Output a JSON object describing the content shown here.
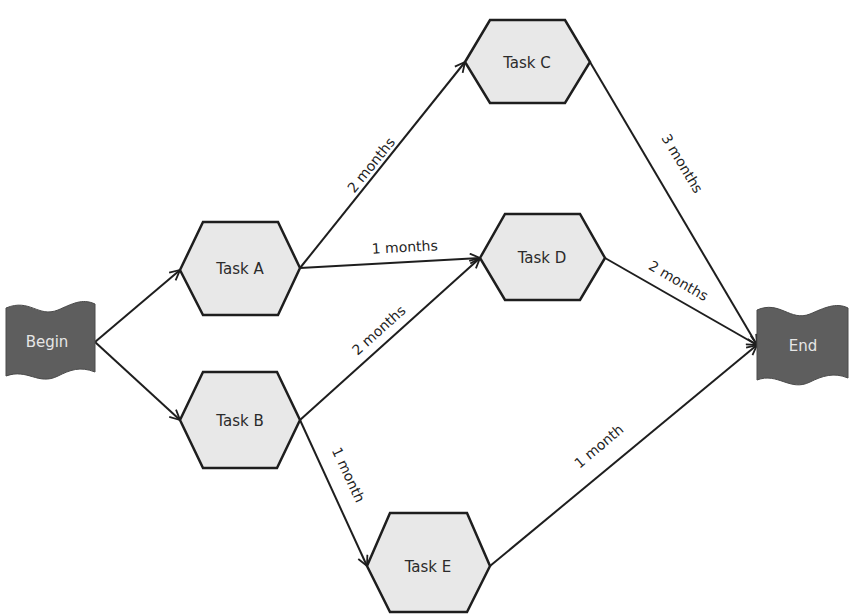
{
  "diagram": {
    "type": "network-diagram",
    "colors": {
      "task_fill": "#e8e8e8",
      "task_stroke": "#1e1e1e",
      "flag_fill": "#5e5e5e",
      "flag_text": "#e6e6e6",
      "edge": "#1e1e1e"
    },
    "nodes": {
      "begin": {
        "label": "Begin"
      },
      "task_a": {
        "label": "Task A"
      },
      "task_b": {
        "label": "Task B"
      },
      "task_c": {
        "label": "Task C"
      },
      "task_d": {
        "label": "Task D"
      },
      "task_e": {
        "label": "Task E"
      },
      "end": {
        "label": "End"
      }
    },
    "edges": [
      {
        "from": "Begin",
        "to": "Task A",
        "label": ""
      },
      {
        "from": "Begin",
        "to": "Task B",
        "label": ""
      },
      {
        "from": "Task A",
        "to": "Task C",
        "label": "2 months"
      },
      {
        "from": "Task A",
        "to": "Task D",
        "label": "1 months"
      },
      {
        "from": "Task B",
        "to": "Task D",
        "label": "2 months"
      },
      {
        "from": "Task B",
        "to": "Task E",
        "label": "1 month"
      },
      {
        "from": "Task C",
        "to": "End",
        "label": "3 months"
      },
      {
        "from": "Task D",
        "to": "End",
        "label": "2 months"
      },
      {
        "from": "Task E",
        "to": "End",
        "label": "1 month"
      }
    ]
  }
}
